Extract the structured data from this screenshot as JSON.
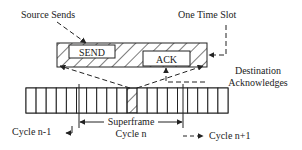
{
  "diagram": {
    "labels": {
      "source_sends": "Source Sends",
      "one_time_slot": "One Time Slot",
      "destination": "Destination",
      "acknowledges": "Acknowledges",
      "superframe": "Superframe",
      "cycle_prev": "Cycle n-1",
      "cycle_current": "Cycle n",
      "cycle_next": "Cycle n+1"
    },
    "slot_detail": {
      "send_label": "SEND",
      "ack_label": "ACK"
    },
    "superframe_bar": {
      "slot_count": 20,
      "highlighted_slot_index": 10
    },
    "colors": {
      "stroke": "#222222",
      "background": "#ffffff"
    }
  }
}
